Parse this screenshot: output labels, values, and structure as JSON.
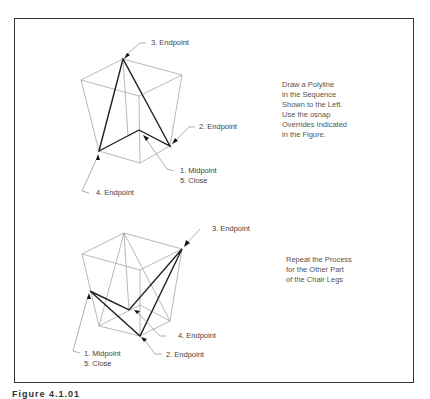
{
  "figure_top": {
    "labels": {
      "endpoint3": "3. Endpoint",
      "endpoint2": "2. Endpoint",
      "midpoint1": "1. Midpoint",
      "close5": "5. Close",
      "endpoint4": "4. Endpoint"
    },
    "instructions": [
      "Draw a Polyline",
      "in the Sequence",
      "Shown to the Left.",
      "Use the osnap",
      "Overrides Indicated",
      "in the Figure."
    ]
  },
  "figure_bottom": {
    "labels": {
      "endpoint3": "3. Endpoint",
      "endpoint4": "4. Endpoint",
      "endpoint2": "2. Endpoint",
      "midpoint1": "1. Midpoint",
      "close5": "5. Close"
    },
    "instructions": [
      "Repeat the Process",
      "for the Other Part",
      "of the Chair Legs"
    ]
  },
  "caption": "Figure 4.1.01"
}
